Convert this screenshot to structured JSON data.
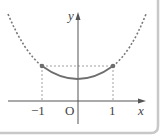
{
  "diagram": {
    "title": "",
    "axes": {
      "x_label": "x",
      "y_label": "y",
      "origin_label": "O",
      "x_ticks": [
        {
          "value": -1,
          "label": "−1"
        },
        {
          "value": 1,
          "label": "1"
        }
      ]
    },
    "curve": {
      "description": "Parabola; solid between x=-1 and x=1, dashed outside",
      "solid_range": [
        -1,
        1
      ],
      "endpoints": [
        {
          "x": -1,
          "label": "(-1, f(-1))",
          "marker": "filled-dot"
        },
        {
          "x": 1,
          "label": "(1, f(1))",
          "marker": "filled-dot"
        }
      ]
    },
    "guides": "Dashed vertical lines from endpoints to x-axis and dashed horizontal line between endpoints",
    "colors": {
      "curve": "#6e6e6e",
      "axis": "#555555",
      "frame": "#c8c8c8",
      "background": "#ffffff"
    }
  }
}
